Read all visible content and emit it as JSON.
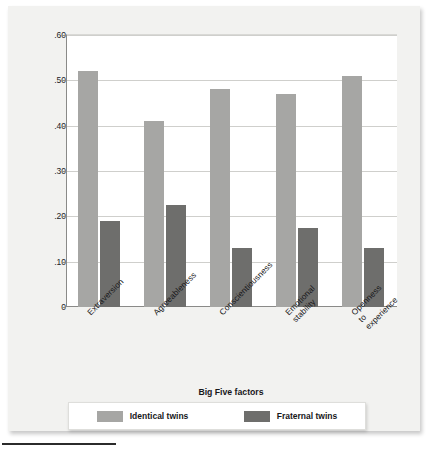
{
  "chart_data": {
    "type": "bar",
    "title": "",
    "xlabel": "Big Five factors",
    "ylabel": "Correlation of scores",
    "categories": [
      "Extraversion",
      "Agreeableness",
      "Conscientiousness",
      "Emotional stability",
      "Openness to experience"
    ],
    "category_lines": [
      [
        "Extraversion"
      ],
      [
        "Agreeableness"
      ],
      [
        "Conscientiousness"
      ],
      [
        "Emotional",
        "stability"
      ],
      [
        "Openness",
        "to",
        "experience"
      ]
    ],
    "series": [
      {
        "name": "Identical twins",
        "color": "#a6a6a4",
        "values": [
          0.52,
          0.41,
          0.48,
          0.47,
          0.51
        ]
      },
      {
        "name": "Fraternal twins",
        "color": "#6e6e6c",
        "values": [
          0.19,
          0.225,
          0.13,
          0.175,
          0.13
        ]
      }
    ],
    "ylim": [
      0,
      0.6
    ],
    "yticks": [
      0,
      0.1,
      0.2,
      0.3,
      0.4,
      0.5,
      0.6
    ],
    "ytick_labels": [
      "0",
      ".10",
      ".20",
      ".30",
      ".40",
      ".50",
      ".60"
    ],
    "grid": true,
    "legend_position": "bottom"
  },
  "legend": {
    "items": [
      {
        "label": "Identical twins",
        "color": "#a6a6a4"
      },
      {
        "label": "Fraternal twins",
        "color": "#6e6e6c"
      }
    ]
  },
  "colors": {
    "identical": "#a6a6a4",
    "fraternal": "#6e6e6c",
    "figure_background": "#f2f2f0",
    "plot_background": "#ffffff",
    "gridline": "#cfcfcc",
    "axis": "#8a8a88",
    "text": "#17171a"
  }
}
